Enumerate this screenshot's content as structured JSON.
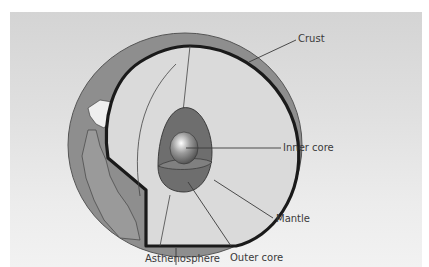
{
  "figure": {
    "title_fragment": ""
  },
  "labels": {
    "crust": "Crust",
    "inner_core": "Inner core",
    "mantle": "Mantle",
    "outer_core": "Outer core",
    "asthenosphere": "Asthenosphere"
  },
  "colors": {
    "background_panel": "#dcdcdc",
    "ocean": "#8c8c8c",
    "land": "#f2f2f2",
    "mantle": "#d9d9d9",
    "outer_core": "#6e6e6e",
    "inner_core": "#9a9a9a",
    "crust_outline": "#1a1a1a",
    "leader_lines": "#3a3a3a"
  }
}
